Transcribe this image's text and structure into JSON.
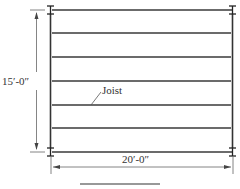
{
  "diagram": {
    "type": "framing-plan",
    "labels": {
      "height_dimension": "15′-0″",
      "width_dimension": "20′-0″",
      "joist": "Joist"
    },
    "joist_count": 7,
    "colors": {
      "line": "#3a3a3a",
      "dimension": "#555555",
      "background": "#ffffff"
    }
  }
}
